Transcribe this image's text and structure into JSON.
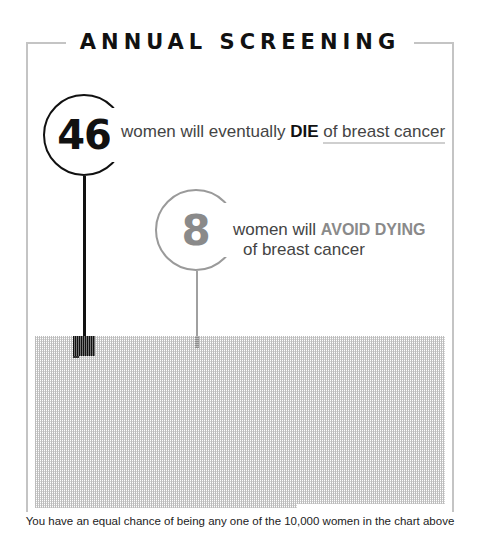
{
  "title": "ANNUAL SCREENING",
  "callouts": {
    "die": {
      "number": "46",
      "text_before": "women will eventually ",
      "emphasis": "DIE",
      "text_after": "of breast cancer",
      "color": "#111111"
    },
    "avoid": {
      "number": "8",
      "text_before": "women will ",
      "emphasis": "AVOID DYING",
      "text_after": "of breast cancer",
      "color": "#8a8a8a"
    }
  },
  "footer": "You have an equal chance of being any one of the 10,000 women in the chart above",
  "chart_data": {
    "type": "heatmap",
    "title": "ANNUAL SCREENING",
    "total_women": 10000,
    "groups": [
      {
        "name": "women will eventually DIE of breast cancer",
        "count": 46,
        "color": "#111111"
      },
      {
        "name": "women will AVOID DYING of breast cancer",
        "count": 8,
        "color": "#8a8a8a"
      },
      {
        "name": "other women",
        "count": 9946,
        "color": "#cccccc"
      }
    ],
    "caption": "You have an equal chance of being any one of the 10,000 women in the chart above"
  }
}
